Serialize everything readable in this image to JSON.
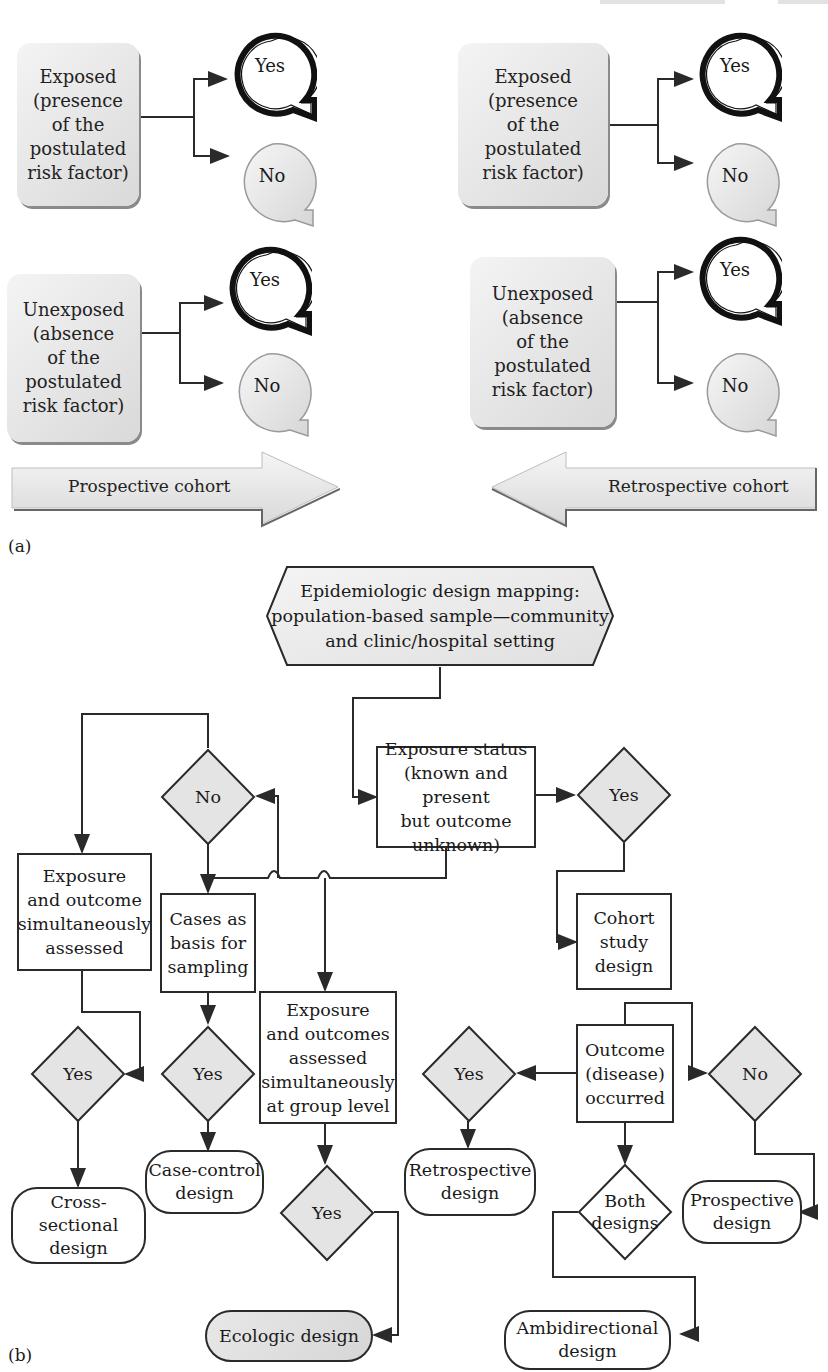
{
  "part_a": {
    "label": "(a)",
    "left": {
      "exposed": {
        "text": "Exposed (presence of the postulated risk factor)",
        "lines": [
          "Exposed",
          "(presence",
          "of the",
          "postulated",
          "risk factor)"
        ],
        "yes": "Yes",
        "no": "No"
      },
      "unexposed": {
        "text": "Unexposed (absence of the postulated risk factor)",
        "lines": [
          "Unexposed",
          "(absence",
          "of the",
          "postulated",
          "risk factor)"
        ],
        "yes": "Yes",
        "no": "No"
      },
      "arrow_label": "Prospective cohort",
      "arrow_direction": "right"
    },
    "right": {
      "exposed": {
        "lines": [
          "Exposed",
          "(presence",
          "of the",
          "postulated",
          "risk factor)"
        ],
        "yes": "Yes",
        "no": "No"
      },
      "unexposed": {
        "lines": [
          "Unexposed",
          "(absence",
          "of the",
          "postulated",
          "risk factor)"
        ],
        "yes": "Yes",
        "no": "No"
      },
      "arrow_label": "Retrospective cohort",
      "arrow_direction": "left"
    }
  },
  "part_b": {
    "label": "(b)",
    "start": {
      "lines": [
        "Epidemiologic design mapping:",
        "population-based sample—community",
        "and clinic/hospital setting"
      ]
    },
    "exposure_status": {
      "lines": [
        "Exposure status",
        "(known and present",
        "but outcome",
        "unknown)"
      ]
    },
    "decision_no_top": "No",
    "decision_yes_top": "Yes",
    "cross_sectional_box": {
      "lines": [
        "Exposure",
        "and outcome",
        "simultaneously",
        "assessed"
      ]
    },
    "cases_box": {
      "lines": [
        "Cases as",
        "basis for",
        "sampling"
      ]
    },
    "ecologic_box": {
      "lines": [
        "Exposure",
        "and outcomes",
        "assessed",
        "simultaneously",
        "at group level"
      ]
    },
    "cohort_box": {
      "lines": [
        "Cohort",
        "study",
        "design"
      ]
    },
    "outcome_box": {
      "lines": [
        "Outcome",
        "(disease)",
        "occurred"
      ]
    },
    "decision_yes_cs": "Yes",
    "decision_yes_cc": "Yes",
    "decision_yes_eco": "Yes",
    "decision_yes_retro": "Yes",
    "decision_no_prosp": "No",
    "decision_both": {
      "lines": [
        "Both",
        "designs"
      ]
    },
    "terminals": {
      "cross_sectional": {
        "lines": [
          "Cross-",
          "sectional",
          "design"
        ]
      },
      "case_control": {
        "lines": [
          "Case-control",
          "design"
        ]
      },
      "ecologic": {
        "lines": [
          "Ecologic design"
        ]
      },
      "retrospective": {
        "lines": [
          "Retrospective",
          "design"
        ]
      },
      "prospective": {
        "lines": [
          "Prospective",
          "design"
        ]
      },
      "ambidirectional": {
        "lines": [
          "Ambidirectional",
          "design"
        ]
      }
    }
  },
  "colors": {
    "line": "#2a2a2a",
    "shade_light": "#f2f2f2",
    "shade_dark": "#d4d4d4",
    "background": "#ffffff"
  }
}
